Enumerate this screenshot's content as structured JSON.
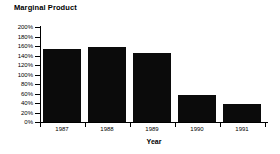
{
  "chart_data": {
    "type": "bar",
    "title": "Marginal Product",
    "xlabel": "Year",
    "ylabel": "",
    "categories": [
      "1987",
      "1988",
      "1989",
      "1990",
      "1991"
    ],
    "values": [
      153,
      158,
      146,
      56,
      37
    ],
    "value_suffix": "%",
    "ylim": [
      0,
      200
    ],
    "ytick_step": 20,
    "ytick_labels": [
      "0%",
      "20%",
      "40%",
      "60%",
      "80%",
      "100%",
      "120%",
      "140%",
      "160%",
      "180%",
      "200%"
    ],
    "ytick_values": [
      0,
      20,
      40,
      60,
      80,
      100,
      120,
      140,
      160,
      180,
      200
    ],
    "grid": false,
    "legend": false,
    "bar_color": "#0b0b0b",
    "axis_color": "#000000",
    "background_color": "#ffffff"
  }
}
